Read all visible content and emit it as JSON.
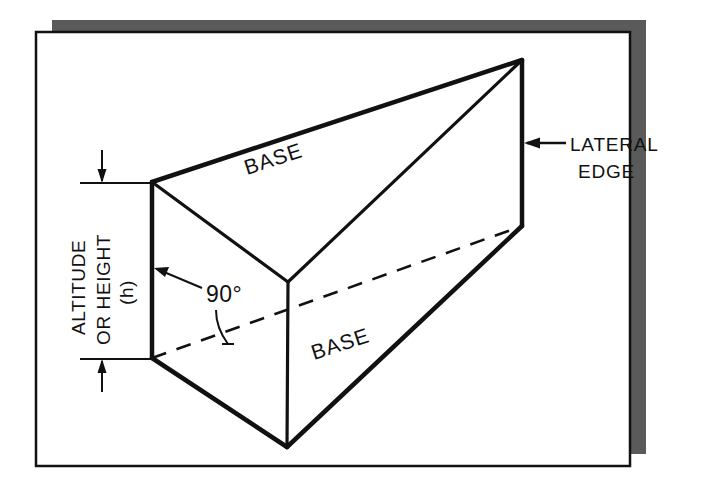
{
  "figure": {
    "kind": "geometry-diagram",
    "background_color": "#ffffff",
    "paper_color": "#ffffff",
    "shadow_color": "#5a5a5a",
    "ink_color": "#111111",
    "labels": {
      "base_top": "BASE",
      "base_bottom": "BASE",
      "right_angle": "90°",
      "lateral_edge_line1": "LATERAL",
      "lateral_edge_line2": "EDGE",
      "altitude_line1": "ALTITUDE",
      "altitude_line2": "OR HEIGHT",
      "altitude_line3": "(h)"
    },
    "annotations": {
      "dimension_name": "altitude-dimension",
      "dimension_arrow_top": "arrow-down",
      "dimension_arrow_bottom": "arrow-up",
      "lateral_edge_arrow": "arrow-left",
      "angle_arrow": "arrow-up-left",
      "hidden_edge_style": "dashed"
    }
  }
}
